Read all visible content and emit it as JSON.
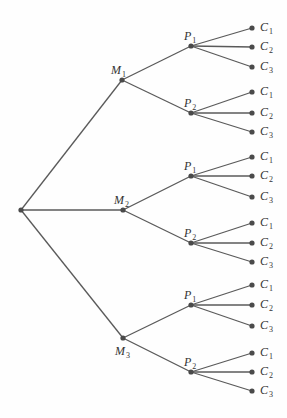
{
  "diagram": {
    "type": "tree",
    "root": {
      "x": 21,
      "y": 210
    },
    "levels": [
      {
        "name": "M",
        "nodes": [
          {
            "id": "M1",
            "letter": "M",
            "sub": "1",
            "x": 122,
            "y": 80,
            "lx": 111,
            "ly": 64
          },
          {
            "id": "M2",
            "letter": "M",
            "sub": "2",
            "x": 123,
            "y": 210,
            "lx": 114,
            "ly": 194
          },
          {
            "id": "M3",
            "letter": "M",
            "sub": "3",
            "x": 123,
            "y": 338,
            "lx": 115,
            "ly": 345
          }
        ]
      },
      {
        "name": "P",
        "nodes": [
          {
            "id": "M1P1",
            "parent": "M1",
            "letter": "P",
            "sub": "1",
            "x": 191,
            "y": 46,
            "lx": 184,
            "ly": 30
          },
          {
            "id": "M1P2",
            "parent": "M1",
            "letter": "P",
            "sub": "2",
            "x": 191,
            "y": 113,
            "lx": 184,
            "ly": 97
          },
          {
            "id": "M2P1",
            "parent": "M2",
            "letter": "P",
            "sub": "1",
            "x": 191,
            "y": 176,
            "lx": 184,
            "ly": 160
          },
          {
            "id": "M2P2",
            "parent": "M2",
            "letter": "P",
            "sub": "2",
            "x": 191,
            "y": 243,
            "lx": 184,
            "ly": 227
          },
          {
            "id": "M3P1",
            "parent": "M3",
            "letter": "P",
            "sub": "1",
            "x": 191,
            "y": 305,
            "lx": 184,
            "ly": 289
          },
          {
            "id": "M3P2",
            "parent": "M3",
            "letter": "P",
            "sub": "2",
            "x": 191,
            "y": 372,
            "lx": 184,
            "ly": 356
          }
        ]
      },
      {
        "name": "C",
        "nodes": [
          {
            "parent": "M1P1",
            "letter": "C",
            "sub": "1",
            "x": 252,
            "y": 28
          },
          {
            "parent": "M1P1",
            "letter": "C",
            "sub": "2",
            "x": 252,
            "y": 47
          },
          {
            "parent": "M1P1",
            "letter": "C",
            "sub": "3",
            "x": 252,
            "y": 67
          },
          {
            "parent": "M1P2",
            "letter": "C",
            "sub": "1",
            "x": 252,
            "y": 92
          },
          {
            "parent": "M1P2",
            "letter": "C",
            "sub": "2",
            "x": 252,
            "y": 113
          },
          {
            "parent": "M1P2",
            "letter": "C",
            "sub": "3",
            "x": 252,
            "y": 132
          },
          {
            "parent": "M2P1",
            "letter": "C",
            "sub": "1",
            "x": 252,
            "y": 157
          },
          {
            "parent": "M2P1",
            "letter": "C",
            "sub": "2",
            "x": 252,
            "y": 176
          },
          {
            "parent": "M2P1",
            "letter": "C",
            "sub": "3",
            "x": 252,
            "y": 197
          },
          {
            "parent": "M2P2",
            "letter": "C",
            "sub": "1",
            "x": 252,
            "y": 223
          },
          {
            "parent": "M2P2",
            "letter": "C",
            "sub": "2",
            "x": 252,
            "y": 243
          },
          {
            "parent": "M2P2",
            "letter": "C",
            "sub": "3",
            "x": 252,
            "y": 262
          },
          {
            "parent": "M3P1",
            "letter": "C",
            "sub": "1",
            "x": 252,
            "y": 285
          },
          {
            "parent": "M3P1",
            "letter": "C",
            "sub": "2",
            "x": 252,
            "y": 305
          },
          {
            "parent": "M3P1",
            "letter": "C",
            "sub": "3",
            "x": 252,
            "y": 326
          },
          {
            "parent": "M3P2",
            "letter": "C",
            "sub": "1",
            "x": 252,
            "y": 353
          },
          {
            "parent": "M3P2",
            "letter": "C",
            "sub": "2",
            "x": 252,
            "y": 372
          },
          {
            "parent": "M3P2",
            "letter": "C",
            "sub": "3",
            "x": 252,
            "y": 391
          }
        ]
      }
    ],
    "colors": {
      "edge": "#5a5a5a",
      "node": "#4a4a4a",
      "label": "#333333"
    }
  }
}
